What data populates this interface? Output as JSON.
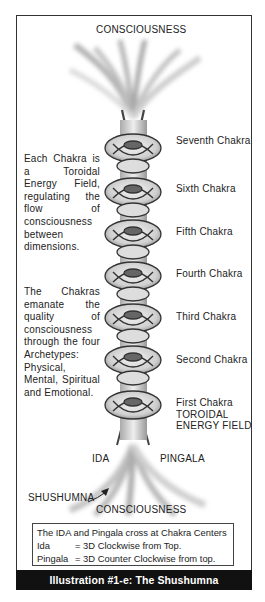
{
  "diagram": {
    "top_label": "CONSCIOUSNESS",
    "bottom_label": "CONSCIOUSNESS",
    "left_notes": [
      {
        "text": "Each Chakra is a Toroidal Energy Field, regulating the flow of consciousness between dimensions."
      },
      {
        "text": "The Chakras emanate the quality of consciousness through the four Archetypes: Physical, Mental, Spiritual and Emotional."
      }
    ],
    "chakras": [
      {
        "label": "Seventh Chakra"
      },
      {
        "label": "Sixth Chakra"
      },
      {
        "label": "Fifth Chakra"
      },
      {
        "label": "Fourth Chakra"
      },
      {
        "label": "Third Chakra"
      },
      {
        "label": "Second Chakra"
      },
      {
        "label": "First Chakra"
      }
    ],
    "toroidal_label_1": "TOROIDAL",
    "toroidal_label_2": "ENERGY  FIELD",
    "ida_label": "IDA",
    "pingala_label": "PINGALA",
    "shushumna_label": "SHUSHUMNA",
    "legend": {
      "title": "The IDA and Pingala cross at Chakra Centers",
      "rows": [
        {
          "key": "Ida",
          "value": "= 3D Clockwise from Top."
        },
        {
          "key": "Pingala",
          "value": "= 3D Counter Clockwise from top."
        }
      ]
    },
    "caption": "Illustration #1-e: The Shushumna"
  }
}
